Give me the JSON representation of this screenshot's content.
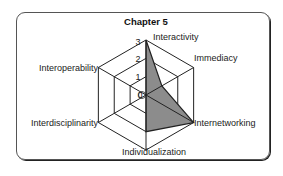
{
  "chart_data": {
    "type": "radar",
    "title": "Chapter 5",
    "axes": [
      "Interactivity",
      "Immediacy",
      "Internetworking",
      "Individualization",
      "Interdisciplinarity",
      "Interoperability"
    ],
    "values": [
      3,
      1,
      3,
      2,
      0,
      0
    ],
    "scale": {
      "min": 0,
      "max": 3,
      "ticks": [
        "0",
        "1",
        "2",
        "3"
      ]
    },
    "grid": "hexagonal",
    "fill_color": "#8c8c8c",
    "line_color": "#222222"
  }
}
